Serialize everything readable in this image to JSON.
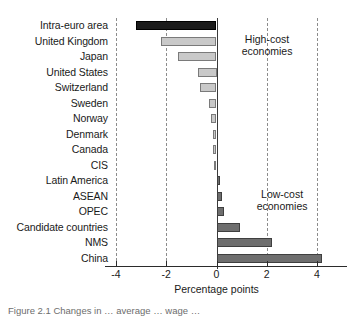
{
  "chart_data": {
    "type": "bar",
    "orientation": "horizontal",
    "title": "",
    "xlabel": "Percentage points",
    "ylabel": "",
    "xlim": [
      -4,
      4
    ],
    "xticks": [
      -4,
      -2,
      0,
      2,
      4
    ],
    "xtick_labels": [
      "-4",
      "-2",
      "0",
      "2",
      "4"
    ],
    "grid": "vertical-dashed",
    "legend": "none",
    "categories": [
      "Intra-euro area",
      "United Kingdom",
      "Japan",
      "United States",
      "Switzerland",
      "Sweden",
      "Norway",
      "Denmark",
      "Canada",
      "CIS",
      "Latin America",
      "ASEAN",
      "OPEC",
      "Candidate countries",
      "NMS",
      "China"
    ],
    "values": [
      -3.2,
      -2.2,
      -1.55,
      -0.75,
      -0.65,
      -0.3,
      -0.2,
      -0.15,
      -0.12,
      -0.1,
      0.15,
      0.2,
      0.3,
      0.95,
      2.2,
      4.2
    ],
    "bar_colors": [
      "#1b1b1b",
      "#c9c9c9",
      "#c9c9c9",
      "#c9c9c9",
      "#c9c9c9",
      "#c9c9c9",
      "#c9c9c9",
      "#c9c9c9",
      "#c9c9c9",
      "#c9c9c9",
      "#6e6e6e",
      "#6e6e6e",
      "#6e6e6e",
      "#6e6e6e",
      "#6e6e6e",
      "#6e6e6e"
    ],
    "annotations": [
      {
        "text_line1": "High-cost",
        "text_line2": "economies",
        "x": 1.0,
        "category_index": 1
      },
      {
        "text_line1": "Low-cost",
        "text_line2": "economies",
        "x": 1.6,
        "category_index": 11
      }
    ],
    "colors": {
      "negative_highlight": "#1b1b1b",
      "negative": "#c9c9c9",
      "positive": "#6e6e6e",
      "grid": "#8c8c8c",
      "axis": "#2b2b2b",
      "text": "#1a1a1a"
    }
  },
  "caption": {
    "text": "Figure 2.1  Changes in … average … wage …"
  }
}
